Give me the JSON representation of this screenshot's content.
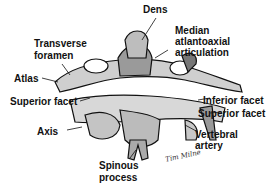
{
  "figure": {
    "labels": {
      "dens": "Dens",
      "median_1": "Median",
      "median_2": "atlantoaxial",
      "median_3": "articulation",
      "transverse_1": "Transverse",
      "transverse_2": "foramen",
      "atlas": "Atlas",
      "superior_facet_left": "Superior facet",
      "inferior_facet": "Inferior facet",
      "superior_facet_right": "Superior facet",
      "axis": "Axis",
      "vertebral_1": "Vertebral",
      "vertebral_2": "artery",
      "spinous_1": "Spinous",
      "spinous_2": "process"
    },
    "signature": "Tim Milne"
  }
}
